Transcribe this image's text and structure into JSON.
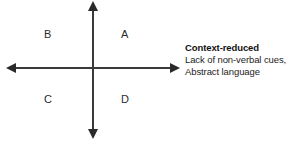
{
  "diagram": {
    "type": "two-axis-quadrant",
    "background_color": "#ffffff",
    "line_color": "#3a3a3a",
    "quadrants": [
      {
        "id": "b",
        "label": "B",
        "position": "top-left"
      },
      {
        "id": "a",
        "label": "A",
        "position": "top-right"
      },
      {
        "id": "c",
        "label": "C",
        "position": "bottom-left"
      },
      {
        "id": "d",
        "label": "D",
        "position": "bottom-right"
      }
    ],
    "axes": {
      "horizontal": {
        "name": "horizontal-axis",
        "arrowheads": "both",
        "right_annotation": {
          "heading": "Context-reduced",
          "lines": [
            "Lack of non-verbal cues,",
            "Abstract language"
          ]
        }
      },
      "vertical": {
        "name": "vertical-axis",
        "arrowheads": "both"
      }
    }
  }
}
